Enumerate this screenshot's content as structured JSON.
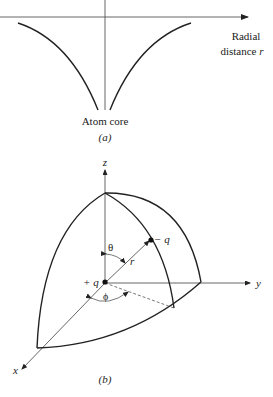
{
  "panel_a": {
    "axis_label_line1": "Radial",
    "axis_label_line2": "distance",
    "axis_label_var": "r",
    "center_label": "Atom core",
    "caption": "(a)"
  },
  "panel_b": {
    "z_label": "z",
    "y_label": "y",
    "x_label": "x",
    "theta_label": "θ",
    "phi_label": "ϕ",
    "r_label": "r",
    "pos_charge_label": "+ q",
    "neg_charge_label": "− q",
    "caption": "(b)"
  },
  "colors": {
    "stroke": "#222222",
    "thin_stroke": "#555555",
    "background": "#ffffff"
  }
}
